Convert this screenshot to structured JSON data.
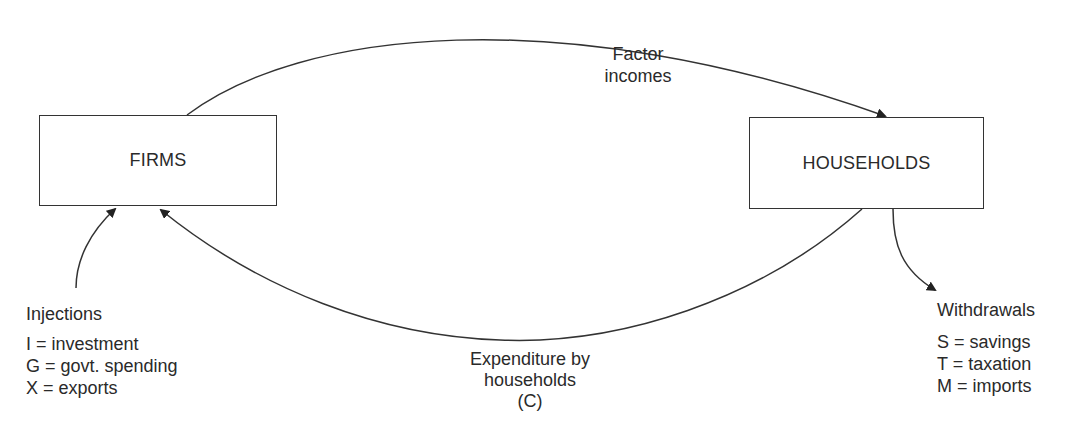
{
  "diagram": {
    "type": "circular-flow",
    "nodes": {
      "firms": {
        "label": "FIRMS"
      },
      "households": {
        "label": "HOUSEHOLDS"
      }
    },
    "flows": {
      "factor_incomes": {
        "line1": "Factor",
        "line2": "incomes",
        "from": "firms",
        "to": "households"
      },
      "expenditure": {
        "line1": "Expenditure by",
        "line2": "households",
        "line3": "(C)",
        "from": "households",
        "to": "firms"
      }
    },
    "injections": {
      "title": "Injections",
      "items": [
        {
          "text": "I = investment"
        },
        {
          "text": "G = govt. spending"
        },
        {
          "text": "X = exports"
        }
      ]
    },
    "withdrawals": {
      "title": "Withdrawals",
      "items": [
        {
          "text": "S = savings"
        },
        {
          "text": "T = taxation"
        },
        {
          "text": "M = imports"
        }
      ]
    },
    "colors": {
      "line": "#333333",
      "text": "#2a2a2a",
      "background": "#ffffff"
    }
  }
}
